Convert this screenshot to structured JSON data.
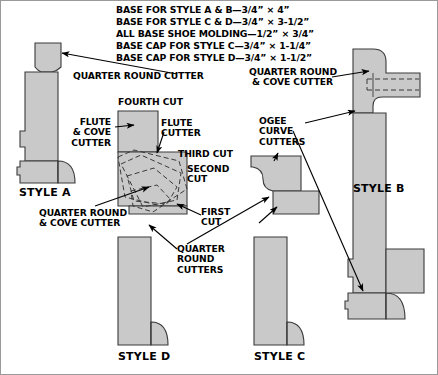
{
  "figure": {
    "background_color": "#ffffff",
    "profile_fill": "#c9c9c9",
    "profile_stroke": "#3a3a3a",
    "text_color": "#000000",
    "border_color": "#9a9a9a"
  },
  "specs": {
    "lines": [
      "BASE FOR STYLE A & B—3/4” × 4”",
      "BASE FOR STYLE C & D—3/4” × 3-1/2”",
      "ALL BASE SHOE MOLDING—1/2” × 3/4”",
      "BASE CAP FOR STYLE C—3/4” × 1-1/4”",
      "BASE CAP FOR STYLE D—3/4” × 1-1/2”"
    ]
  },
  "callouts": {
    "quarter_round_cutter": "QUARTER ROUND CUTTER",
    "flute_and_cove_cutter": "FLUTE\n& COVE\nCUTTER",
    "flute_cutter": "FLUTE\nCUTTER",
    "quarter_round_and_cove_cutter_left": "QUARTER ROUND\n& COVE CUTTER",
    "quarter_round_and_cove_cutter_right": "QUARTER ROUND\n& COVE CUTTER",
    "ogee_curve_cutters": "OGEE\nCURVE\nCUTTERS",
    "quarter_round_cutters": "QUARTER\nROUND\nCUTTERS"
  },
  "cuts": {
    "fourth": "FOURTH CUT",
    "third": "THIRD CUT",
    "second": "SECOND\nCUT",
    "first": "FIRST\nCUT"
  },
  "styles": {
    "a": "STYLE A",
    "b": "STYLE B",
    "c": "STYLE C",
    "d": "STYLE D"
  }
}
